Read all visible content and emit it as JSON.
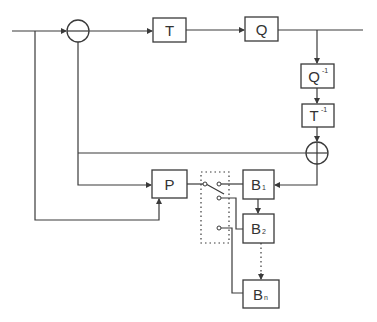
{
  "diagram": {
    "type": "block-diagram",
    "blocks": {
      "transform": {
        "label": "T",
        "sup": ""
      },
      "quantizer": {
        "label": "Q",
        "sup": ""
      },
      "inverse_quantizer": {
        "label": "Q",
        "sup": "-1"
      },
      "inverse_transform": {
        "label": "T",
        "sup": "-1"
      },
      "predictor": {
        "label": "P",
        "sup": ""
      },
      "buffer_1": {
        "label": "B",
        "sub": "1"
      },
      "buffer_2": {
        "label": "B",
        "sub": "2"
      },
      "buffer_n": {
        "label": "B",
        "sub": "n"
      }
    },
    "nodes": {
      "subtractor": {
        "symbol": "minus"
      },
      "adder": {
        "symbol": "plus"
      }
    },
    "switch": {
      "contacts": 3,
      "selected": 1
    },
    "colors": {
      "stroke": "#3a3a3a",
      "background": "#ffffff",
      "text": "#333333"
    }
  }
}
